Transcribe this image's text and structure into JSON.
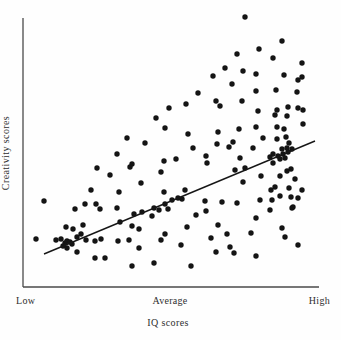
{
  "figure": {
    "background": "#fefefe",
    "dot_color": "#141414",
    "axis_color": "#4a4a4a",
    "line_color": "#161616",
    "text_color": "#2e2e2e",
    "y_axis_label": "Creativity scores",
    "x_axis_label": "IQ scores",
    "x_tick_labels": [
      "Low",
      "Average",
      "High"
    ]
  },
  "chart_data": {
    "type": "scatter",
    "title": "",
    "xlabel": "IQ scores",
    "ylabel": "Creativity scores",
    "x_tick_labels": [
      "Low",
      "Average",
      "High"
    ],
    "grid": "off",
    "legend": "none",
    "coordinate_space": "image pixels, 341x340 canvas",
    "plot_area_px": {
      "left": 23,
      "top": 18,
      "right": 319,
      "bottom": 287
    },
    "regression_line_px": {
      "x1": 44,
      "y1": 254,
      "x2": 315,
      "y2": 141
    },
    "point_radius_px": 2.7,
    "points_px": [
      [
        245,
        17
      ],
      [
        282,
        41
      ],
      [
        259,
        49
      ],
      [
        237,
        54
      ],
      [
        273,
        58
      ],
      [
        302,
        63
      ],
      [
        225,
        68
      ],
      [
        243,
        71
      ],
      [
        256,
        74
      ],
      [
        284,
        75
      ],
      [
        213,
        76
      ],
      [
        302,
        77
      ],
      [
        298,
        80
      ],
      [
        232,
        84
      ],
      [
        276,
        90
      ],
      [
        256,
        91
      ],
      [
        297,
        92
      ],
      [
        198,
        93
      ],
      [
        242,
        101
      ],
      [
        216,
        101
      ],
      [
        186,
        104
      ],
      [
        220,
        106
      ],
      [
        288,
        107
      ],
      [
        169,
        108
      ],
      [
        277,
        110
      ],
      [
        298,
        108
      ],
      [
        303,
        110
      ],
      [
        258,
        111
      ],
      [
        275,
        115
      ],
      [
        287,
        116
      ],
      [
        156,
        118
      ],
      [
        303,
        124
      ],
      [
        256,
        127
      ],
      [
        277,
        127
      ],
      [
        165,
        128
      ],
      [
        239,
        129
      ],
      [
        284,
        129
      ],
      [
        218,
        132
      ],
      [
        188,
        134
      ],
      [
        127,
        138
      ],
      [
        263,
        138
      ],
      [
        286,
        137
      ],
      [
        277,
        139
      ],
      [
        233,
        142
      ],
      [
        289,
        143
      ],
      [
        145,
        143
      ],
      [
        217,
        144
      ],
      [
        193,
        148
      ],
      [
        253,
        148
      ],
      [
        229,
        147
      ],
      [
        282,
        149
      ],
      [
        287,
        148
      ],
      [
        292,
        149
      ],
      [
        288,
        152
      ],
      [
        283,
        154
      ],
      [
        278,
        156
      ],
      [
        273,
        154
      ],
      [
        270,
        157
      ],
      [
        280,
        159
      ],
      [
        285,
        158
      ],
      [
        117,
        154
      ],
      [
        240,
        158
      ],
      [
        206,
        156
      ],
      [
        207,
        163
      ],
      [
        176,
        159
      ],
      [
        164,
        161
      ],
      [
        132,
        164
      ],
      [
        273,
        163
      ],
      [
        97,
        168
      ],
      [
        130,
        167
      ],
      [
        245,
        168
      ],
      [
        161,
        172
      ],
      [
        291,
        169
      ],
      [
        287,
        171
      ],
      [
        110,
        175
      ],
      [
        261,
        176
      ],
      [
        280,
        176
      ],
      [
        235,
        170
      ],
      [
        243,
        182
      ],
      [
        295,
        179
      ],
      [
        141,
        183
      ],
      [
        164,
        192
      ],
      [
        185,
        190
      ],
      [
        91,
        190
      ],
      [
        119,
        192
      ],
      [
        271,
        190
      ],
      [
        275,
        187
      ],
      [
        289,
        188
      ],
      [
        302,
        190
      ],
      [
        280,
        196
      ],
      [
        291,
        197
      ],
      [
        298,
        198
      ],
      [
        293,
        207
      ],
      [
        44,
        201
      ],
      [
        85,
        204
      ],
      [
        96,
        204
      ],
      [
        260,
        200
      ],
      [
        272,
        200
      ],
      [
        205,
        201
      ],
      [
        222,
        202
      ],
      [
        237,
        203
      ],
      [
        75,
        209
      ],
      [
        100,
        209
      ],
      [
        117,
        208
      ],
      [
        154,
        208
      ],
      [
        159,
        210
      ],
      [
        165,
        204
      ],
      [
        168,
        209
      ],
      [
        172,
        200
      ],
      [
        178,
        198
      ],
      [
        182,
        199
      ],
      [
        134,
        214
      ],
      [
        142,
        212
      ],
      [
        152,
        216
      ],
      [
        196,
        215
      ],
      [
        206,
        211
      ],
      [
        270,
        210
      ],
      [
        292,
        208
      ],
      [
        120,
        222
      ],
      [
        83,
        225
      ],
      [
        66,
        227
      ],
      [
        73,
        229
      ],
      [
        256,
        218
      ],
      [
        218,
        225
      ],
      [
        187,
        227
      ],
      [
        132,
        226
      ],
      [
        139,
        229
      ],
      [
        165,
        234
      ],
      [
        227,
        234
      ],
      [
        81,
        234
      ],
      [
        77,
        237
      ],
      [
        36,
        239
      ],
      [
        56,
        240
      ],
      [
        61,
        239
      ],
      [
        63,
        246
      ],
      [
        65,
        243
      ],
      [
        67,
        241
      ],
      [
        70,
        242
      ],
      [
        72,
        244
      ],
      [
        67,
        248
      ],
      [
        86,
        240
      ],
      [
        95,
        241
      ],
      [
        101,
        239
      ],
      [
        118,
        241
      ],
      [
        129,
        240
      ],
      [
        161,
        240
      ],
      [
        211,
        238
      ],
      [
        251,
        233
      ],
      [
        282,
        228
      ],
      [
        285,
        237
      ],
      [
        77,
        252
      ],
      [
        139,
        248
      ],
      [
        181,
        245
      ],
      [
        230,
        247
      ],
      [
        298,
        245
      ],
      [
        95,
        258
      ],
      [
        105,
        258
      ],
      [
        216,
        252
      ],
      [
        234,
        253
      ],
      [
        256,
        256
      ],
      [
        154,
        263
      ],
      [
        132,
        266
      ],
      [
        191,
        266
      ]
    ]
  }
}
